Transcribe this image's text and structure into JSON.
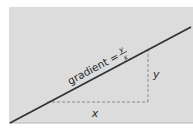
{
  "diagram": {
    "panel_color": "#dcdcdc",
    "line_color": "#333333",
    "dash_color": "#8a8a8a",
    "label_color": "#2a2a2a",
    "line_label": {
      "prefix": "gradient =",
      "numerator": "y",
      "denominator": "x"
    },
    "horizontal_leg_label": "x",
    "vertical_leg_label": "y"
  }
}
